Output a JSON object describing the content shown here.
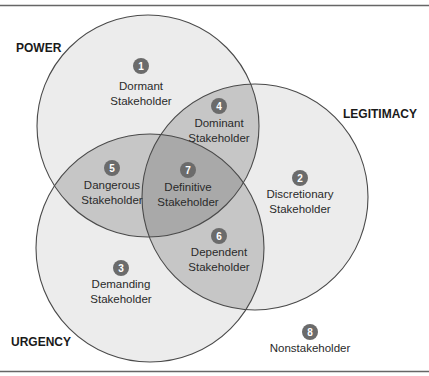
{
  "colors": {
    "single": "#ececec",
    "pair": "#c6c6c6",
    "triple": "#a9a9a9",
    "outline": "#4a4a4a",
    "badge": "#6b6b6b",
    "border": "#666666"
  },
  "sets": {
    "power": {
      "label": "POWER"
    },
    "legitimacy": {
      "label": "LEGITIMACY"
    },
    "urgency": {
      "label": "URGENCY"
    }
  },
  "regions": [
    {
      "number": "1",
      "line1": "Dormant",
      "line2": "Stakeholder"
    },
    {
      "number": "2",
      "line1": "Discretionary",
      "line2": "Stakeholder"
    },
    {
      "number": "3",
      "line1": "Demanding",
      "line2": "Stakeholder"
    },
    {
      "number": "4",
      "line1": "Dominant",
      "line2": "Stakeholder"
    },
    {
      "number": "5",
      "line1": "Dangerous",
      "line2": "Stakeholder"
    },
    {
      "number": "6",
      "line1": "Dependent",
      "line2": "Stakeholder"
    },
    {
      "number": "7",
      "line1": "Definitive",
      "line2": "Stakeholder"
    },
    {
      "number": "8",
      "line1": "Nonstakeholder",
      "line2": ""
    }
  ]
}
